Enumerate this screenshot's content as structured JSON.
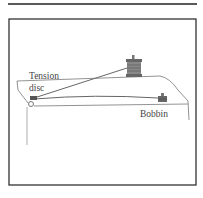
{
  "figure": {
    "labels": {
      "tension_disc_line1": "Tension",
      "tension_disc_line2": "disc",
      "bobbin": "Bobbin"
    },
    "parts": [
      "tension disc",
      "thread spool",
      "bobbin",
      "sewing machine bed",
      "thread"
    ],
    "colors": {
      "ink": "#333333",
      "light_ink": "#777777",
      "spool_fill": "#888888"
    }
  }
}
